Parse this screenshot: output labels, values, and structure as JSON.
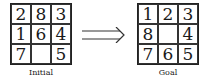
{
  "initial": {
    "label": "Initial",
    "cells": [
      "2",
      "8",
      "3",
      "1",
      "6",
      "4",
      "7",
      "",
      "5"
    ]
  },
  "goal": {
    "label": "Goal",
    "cells": [
      "1",
      "2",
      "3",
      "8",
      "",
      "4",
      "7",
      "6",
      "5"
    ]
  },
  "arrow": {
    "icon": "double-right-arrow-icon"
  }
}
